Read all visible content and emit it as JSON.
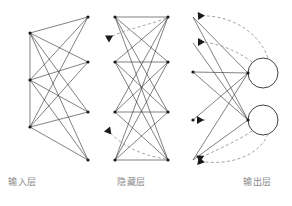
{
  "diagram": {
    "background_color": "#ffffff",
    "line_color": "#2b2b2b",
    "dashed_color": "#9a9a9a",
    "node_color": "#1a1a1a",
    "label_color": "#8a8a8a",
    "width": 292,
    "height": 206
  },
  "labels": {
    "input_layer": "输入层",
    "hidden_layer": "隐藏层",
    "output_layer": "输出层"
  },
  "layers": [
    {
      "id": "input",
      "label": "输入层",
      "left_nodes": 3,
      "right_nodes": 3,
      "left_x": 30,
      "right_x": 88,
      "left_node_y": [
        33,
        80,
        127
      ],
      "right_node_y": [
        17,
        62,
        112,
        160
      ],
      "has_circles": false,
      "dashed_feedback": 0
    },
    {
      "id": "hidden",
      "label": "隐藏层",
      "left_x": 115,
      "right_x": 168,
      "node_rows_y": [
        17,
        62,
        112,
        160
      ],
      "horizontal_bars": 4,
      "has_circles": false,
      "dashed_feedback": 2
    },
    {
      "id": "output",
      "label": "输出层",
      "left_x": 193,
      "right_x": 248,
      "left_node_y": [
        17,
        43,
        72,
        120,
        160
      ],
      "circle_centers": [
        [
          263,
          73
        ],
        [
          263,
          120
        ]
      ],
      "circle_radius": 15,
      "has_circles": true,
      "circle_count": 2,
      "dashed_feedback": 4
    }
  ],
  "arrowheads": {
    "count": 6,
    "direction": "left",
    "positions": [
      [
        105,
        38
      ],
      [
        105,
        128
      ],
      [
        190,
        17
      ],
      [
        190,
        43
      ],
      [
        190,
        120
      ],
      [
        190,
        160
      ]
    ]
  }
}
